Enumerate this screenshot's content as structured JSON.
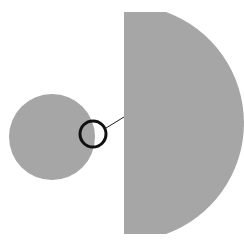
{
  "diagram": {
    "background": "#ffffff",
    "shape_fill": "#a6a6a6",
    "outline_color": "#111111",
    "small_circle": {
      "cx": 52,
      "cy": 137,
      "r": 43
    },
    "large_segment": {
      "x_left": 124,
      "y_top": 12,
      "y_bottom": 234,
      "x_right": 230
    },
    "magnifier_ring": {
      "cx": 93,
      "cy": 134,
      "r": 13
    },
    "leader_line": {
      "x1": 106,
      "y1": 128,
      "x2": 124,
      "y2": 117
    }
  }
}
